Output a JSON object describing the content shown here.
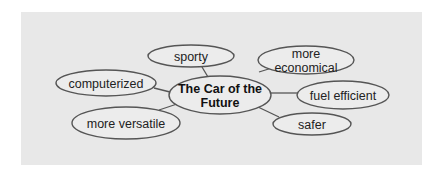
{
  "diagram": {
    "type": "cluster-map",
    "panel": {
      "x": 21,
      "y": 12,
      "w": 401,
      "h": 153,
      "color": "#e8e8e8"
    },
    "center": {
      "lines": [
        "The Car of the",
        "Future"
      ],
      "cx": 220,
      "cy": 95,
      "rx": 51,
      "ry": 19
    },
    "nodes": [
      {
        "id": "sporty",
        "lines": [
          "sporty"
        ],
        "cx": 191,
        "cy": 56,
        "rx": 43,
        "ry": 11,
        "link": [
          202,
          67,
          208,
          77
        ]
      },
      {
        "id": "computerized",
        "lines": [
          "computerized"
        ],
        "cx": 106,
        "cy": 83,
        "rx": 50,
        "ry": 13,
        "link": [
          154,
          88,
          170,
          92
        ]
      },
      {
        "id": "more-versatile",
        "lines": [
          "more versatile"
        ],
        "cx": 126,
        "cy": 123,
        "rx": 54,
        "ry": 16,
        "link": [
          159,
          110,
          180,
          103
        ]
      },
      {
        "id": "more-economical",
        "lines": [
          "more",
          "economical"
        ],
        "cx": 306,
        "cy": 60,
        "rx": 48,
        "ry": 14,
        "link": [
          259,
          72,
          275,
          67
        ]
      },
      {
        "id": "fuel-efficient",
        "lines": [
          "fuel efficient"
        ],
        "cx": 343,
        "cy": 95,
        "rx": 46,
        "ry": 14,
        "link": [
          271,
          93,
          297,
          93
        ]
      },
      {
        "id": "safer",
        "lines": [
          "safer"
        ],
        "cx": 312,
        "cy": 124,
        "rx": 39,
        "ry": 11,
        "link": [
          258,
          107,
          279,
          117
        ]
      }
    ]
  }
}
